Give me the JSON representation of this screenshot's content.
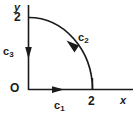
{
  "figure": {
    "type": "math-diagram",
    "colors": {
      "ink": "#1a1a1a",
      "background": "#ffffff"
    },
    "axes": {
      "x_label": "x",
      "y_label": "y",
      "origin_label": "O",
      "x_tick_label": "2",
      "y_tick_label": "2",
      "x_tick_value": 2,
      "y_tick_value": 2
    },
    "paths": [
      {
        "name": "c1",
        "label": "c",
        "subscript": "1",
        "shape": "horizontal-segment",
        "from": [
          0,
          0
        ],
        "to": [
          2,
          0
        ],
        "direction": "rightward"
      },
      {
        "name": "c2",
        "label": "c",
        "subscript": "2",
        "shape": "quarter-arc",
        "radius": 2,
        "from": [
          2,
          0
        ],
        "to": [
          0,
          2
        ],
        "direction": "counterclockwise"
      },
      {
        "name": "c3",
        "label": "c",
        "subscript": "3",
        "shape": "vertical-segment",
        "from": [
          0,
          2
        ],
        "to": [
          0,
          0
        ],
        "direction": "downward"
      }
    ]
  }
}
